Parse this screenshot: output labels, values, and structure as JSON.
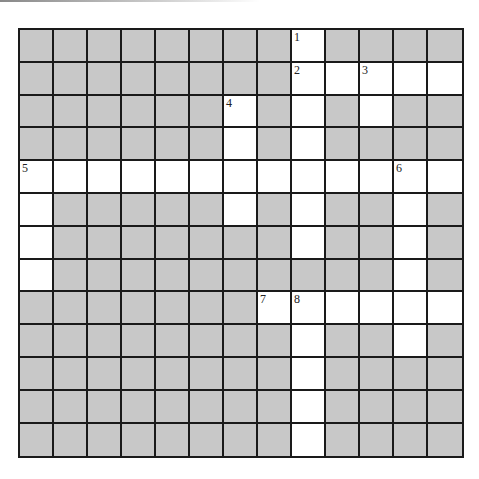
{
  "puzzle": {
    "rows": 13,
    "cols": 13,
    "colors": {
      "block": "#c8c8c8",
      "open": "#ffffff",
      "line": "#1a1a1a"
    },
    "open_cells": [
      [
        0,
        8
      ],
      [
        1,
        8
      ],
      [
        1,
        9
      ],
      [
        1,
        10
      ],
      [
        1,
        11
      ],
      [
        1,
        12
      ],
      [
        2,
        6
      ],
      [
        2,
        8
      ],
      [
        2,
        10
      ],
      [
        3,
        6
      ],
      [
        3,
        8
      ],
      [
        4,
        0
      ],
      [
        4,
        1
      ],
      [
        4,
        2
      ],
      [
        4,
        3
      ],
      [
        4,
        4
      ],
      [
        4,
        5
      ],
      [
        4,
        6
      ],
      [
        4,
        7
      ],
      [
        4,
        8
      ],
      [
        4,
        9
      ],
      [
        4,
        10
      ],
      [
        4,
        11
      ],
      [
        4,
        12
      ],
      [
        5,
        0
      ],
      [
        5,
        6
      ],
      [
        5,
        8
      ],
      [
        5,
        11
      ],
      [
        6,
        0
      ],
      [
        6,
        8
      ],
      [
        6,
        11
      ],
      [
        7,
        0
      ],
      [
        7,
        11
      ],
      [
        8,
        7
      ],
      [
        8,
        8
      ],
      [
        8,
        9
      ],
      [
        8,
        10
      ],
      [
        8,
        11
      ],
      [
        8,
        12
      ],
      [
        9,
        8
      ],
      [
        9,
        11
      ],
      [
        10,
        8
      ],
      [
        11,
        8
      ],
      [
        12,
        8
      ]
    ],
    "numbers": [
      {
        "row": 0,
        "col": 8,
        "label": "1"
      },
      {
        "row": 1,
        "col": 8,
        "label": "2"
      },
      {
        "row": 1,
        "col": 10,
        "label": "3"
      },
      {
        "row": 2,
        "col": 6,
        "label": "4"
      },
      {
        "row": 4,
        "col": 0,
        "label": "5"
      },
      {
        "row": 4,
        "col": 11,
        "label": "6"
      },
      {
        "row": 8,
        "col": 7,
        "label": "7"
      },
      {
        "row": 8,
        "col": 8,
        "label": "8"
      }
    ]
  }
}
